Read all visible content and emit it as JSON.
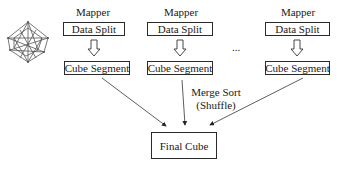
{
  "diagram": {
    "mappers": [
      {
        "title": "Mapper",
        "split": "Data Split",
        "segment": "Cube Segment"
      },
      {
        "title": "Mapper",
        "split": "Data Split",
        "segment": "Cube Segment"
      },
      {
        "title": "Mapper",
        "split": "Data Split",
        "segment": "Cube Segment"
      }
    ],
    "ellipsis": "...",
    "merge_label_line1": "Merge Sort",
    "merge_label_line2": "(Shuffle)",
    "final": "Final Cube",
    "icon": "hypercube-icon",
    "colors": {
      "stroke": "#2a2a2a",
      "background": "#ffffff"
    }
  }
}
